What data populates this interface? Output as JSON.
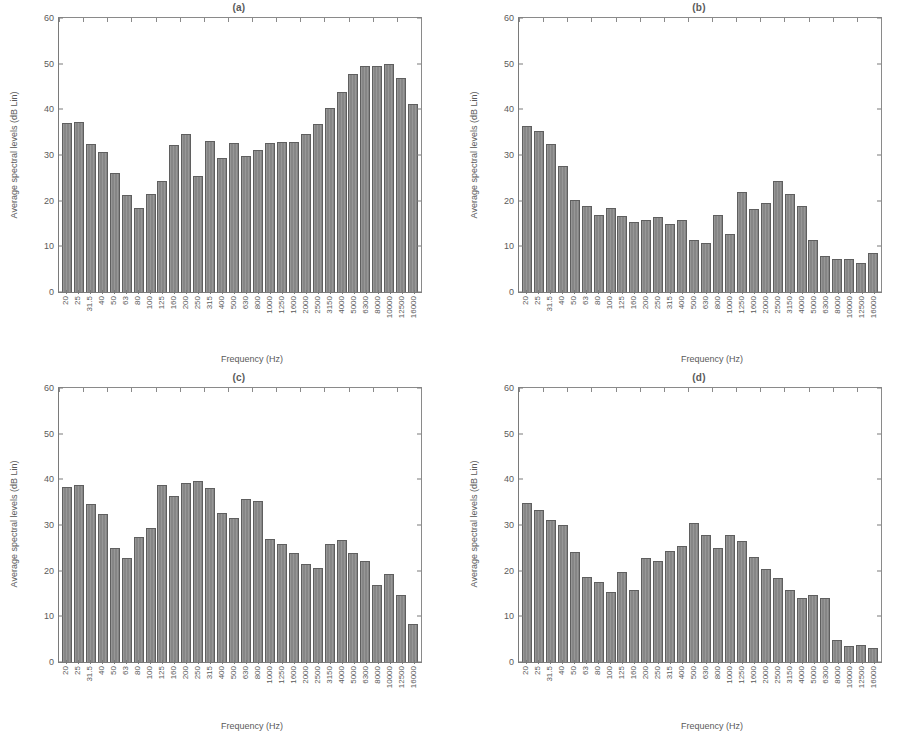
{
  "figure": {
    "background": "#ffffff",
    "bar_color": "#8d8d8d",
    "bar_edge_color": "#5f5f5f",
    "axis_color": "#7a7a7a",
    "text_color": "#5a5a5a"
  },
  "chart_data": [
    {
      "type": "bar",
      "title": "(a)",
      "xlabel": "Frequency (Hz)",
      "ylabel": "Average spectral levels (dB Lin)",
      "ylim": [
        0,
        60
      ],
      "yticks": [
        0,
        10,
        20,
        30,
        40,
        50,
        60
      ],
      "grid": false,
      "legend": "none",
      "categories": [
        "20",
        "25",
        "31.5",
        "40",
        "50",
        "63",
        "80",
        "100",
        "125",
        "160",
        "200",
        "250",
        "315",
        "400",
        "500",
        "630",
        "800",
        "1000",
        "1250",
        "1600",
        "2000",
        "2500",
        "3150",
        "4000",
        "5000",
        "6300",
        "8000",
        "10000",
        "12500",
        "16000"
      ],
      "values": [
        37.0,
        37.2,
        32.4,
        30.6,
        26.0,
        21.2,
        18.5,
        21.5,
        24.4,
        32.2,
        34.6,
        25.5,
        33.0,
        29.4,
        32.6,
        29.8,
        31.2,
        32.6,
        32.8,
        32.9,
        34.5,
        36.7,
        40.4,
        43.7,
        47.8,
        49.6,
        49.5,
        50.0,
        46.8,
        41.2
      ]
    },
    {
      "type": "bar",
      "title": "(b)",
      "xlabel": "Frequency (Hz)",
      "ylabel": "Average spectral levels (dB Lin)",
      "ylim": [
        0,
        60
      ],
      "yticks": [
        0,
        10,
        20,
        30,
        40,
        50,
        60
      ],
      "grid": false,
      "legend": "none",
      "categories": [
        "20",
        "25",
        "31.5",
        "40",
        "50",
        "63",
        "80",
        "100",
        "125",
        "160",
        "200",
        "250",
        "315",
        "400",
        "500",
        "630",
        "800",
        "1000",
        "1250",
        "1600",
        "2000",
        "2500",
        "3150",
        "4000",
        "5000",
        "6300",
        "8000",
        "10000",
        "12500",
        "16000"
      ],
      "values": [
        36.3,
        35.3,
        32.5,
        27.7,
        20.1,
        18.9,
        16.8,
        18.3,
        16.6,
        15.4,
        15.8,
        16.5,
        14.9,
        15.8,
        11.4,
        10.8,
        16.8,
        12.6,
        21.8,
        18.1,
        19.5,
        24.3,
        21.4,
        18.8,
        11.3,
        7.8,
        7.2,
        7.2,
        6.4,
        8.5
      ]
    },
    {
      "type": "bar",
      "title": "(c)",
      "xlabel": "Frequency (Hz)",
      "ylabel": "Average spectral levels (dB Lin)",
      "ylim": [
        0,
        60
      ],
      "yticks": [
        0,
        10,
        20,
        30,
        40,
        50,
        60
      ],
      "grid": false,
      "legend": "none",
      "categories": [
        "20",
        "25",
        "31.5",
        "40",
        "50",
        "63",
        "80",
        "100",
        "125",
        "160",
        "200",
        "250",
        "315",
        "400",
        "500",
        "630",
        "800",
        "1000",
        "1250",
        "1600",
        "2000",
        "2500",
        "3150",
        "4000",
        "5000",
        "6300",
        "8000",
        "10000",
        "12500",
        "16000"
      ],
      "values": [
        38.3,
        38.8,
        34.6,
        32.4,
        24.9,
        22.7,
        27.3,
        29.3,
        38.7,
        36.4,
        39.3,
        39.6,
        38.2,
        32.6,
        31.5,
        35.6,
        35.3,
        27.0,
        25.8,
        23.8,
        21.4,
        20.5,
        25.9,
        26.7,
        23.8,
        22.1,
        16.9,
        19.2,
        14.6,
        8.4
      ]
    },
    {
      "type": "bar",
      "title": "(d)",
      "xlabel": "Frequency (Hz)",
      "ylabel": "Average spectral levels (dB Lin)",
      "ylim": [
        0,
        60
      ],
      "yticks": [
        0,
        10,
        20,
        30,
        40,
        50,
        60
      ],
      "grid": false,
      "legend": "none",
      "categories": [
        "20",
        "25",
        "31.5",
        "40",
        "50",
        "63",
        "80",
        "100",
        "125",
        "160",
        "200",
        "250",
        "315",
        "400",
        "500",
        "630",
        "800",
        "1000",
        "1250",
        "1600",
        "2000",
        "2500",
        "3150",
        "4000",
        "5000",
        "6300",
        "8000",
        "10000",
        "12500",
        "16000"
      ],
      "values": [
        34.9,
        33.2,
        31.1,
        30.1,
        24.1,
        18.6,
        17.5,
        15.4,
        19.8,
        15.8,
        22.7,
        22.1,
        24.3,
        25.3,
        30.5,
        27.9,
        25.0,
        27.9,
        26.5,
        23.0,
        20.4,
        18.3,
        15.8,
        14.0,
        14.6,
        14.0,
        4.9,
        3.6,
        3.7,
        3.1
      ]
    }
  ]
}
